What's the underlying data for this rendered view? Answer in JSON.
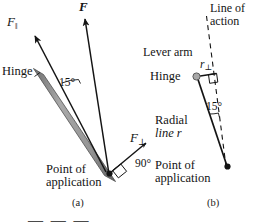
{
  "figure": {
    "background_color": "#ffffff",
    "ink_color": "#141414",
    "rod_color": "#8c8c8c",
    "rod_edge_color": "#555555",
    "hinge_color": "#9a9a9a"
  },
  "panel_a": {
    "caption": "(a)",
    "labels": {
      "force_parallel": "F",
      "force_parallel_sub": "‖",
      "force_vector": "F",
      "force_perp": "F",
      "force_perp_sub": "⊥",
      "hinge": "Hinge",
      "angle_15": "15°",
      "angle_90": "90°",
      "point_of_application_line1": "Point of",
      "point_of_application_line2": "application"
    }
  },
  "panel_b": {
    "caption": "(b)",
    "labels": {
      "line_of_action_line1": "Line of",
      "line_of_action_line2": "action",
      "lever_arm": "Lever arm",
      "lever_arm_symbol": "r",
      "lever_arm_symbol_sub": "⊥",
      "hinge": "Hinge",
      "angle_15": "15°",
      "radial_line_line1": "Radial",
      "radial_line_line2": "line r",
      "point_of_application_line1": "Point of",
      "point_of_application_line2": "application"
    }
  },
  "cropped_caption_fragment": "— — —"
}
